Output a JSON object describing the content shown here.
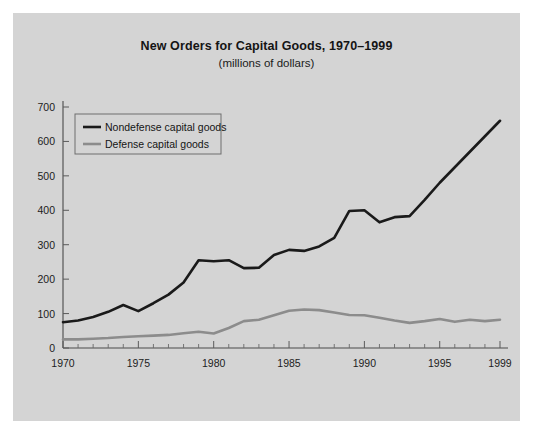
{
  "figure": {
    "background": "#d4d4d4",
    "page_background": "#ffffff"
  },
  "chart_data": {
    "type": "line",
    "title": "New Orders for Capital Goods, 1970–1999",
    "subtitle": "(millions of dollars)",
    "xlabel": "",
    "ylabel": "",
    "grid": false,
    "legend_position": "top-left",
    "xlim": [
      1970,
      1999
    ],
    "ylim": [
      0,
      700
    ],
    "yticks": [
      0,
      100,
      200,
      300,
      400,
      500,
      600,
      700
    ],
    "ytick_labels": [
      "0",
      "100",
      "200",
      "300",
      "400",
      "500",
      "600",
      "700"
    ],
    "xticks": [
      1970,
      1975,
      1980,
      1985,
      1990,
      1995,
      1999
    ],
    "xtick_labels": [
      "1970",
      "1975",
      "1980",
      "1985",
      "1990",
      "1995",
      "1999"
    ],
    "x": [
      1970,
      1971,
      1972,
      1973,
      1974,
      1975,
      1976,
      1977,
      1978,
      1979,
      1980,
      1981,
      1982,
      1983,
      1984,
      1985,
      1986,
      1987,
      1988,
      1989,
      1990,
      1991,
      1992,
      1993,
      1994,
      1995,
      1996,
      1997,
      1998,
      1999
    ],
    "series": [
      {
        "name": "Nondefense capital goods",
        "color": "#1a1a1a",
        "width": 2.6,
        "values": [
          75,
          80,
          90,
          105,
          125,
          107,
          130,
          155,
          190,
          255,
          252,
          255,
          232,
          233,
          270,
          285,
          282,
          295,
          320,
          398,
          400,
          365,
          380,
          383,
          430,
          480,
          525,
          570,
          615,
          660
        ]
      },
      {
        "name": "Defense capital goods",
        "color": "#8c8c8c",
        "width": 2.6,
        "values": [
          25,
          25,
          27,
          29,
          32,
          34,
          36,
          38,
          43,
          47,
          42,
          58,
          78,
          82,
          95,
          108,
          112,
          110,
          103,
          96,
          95,
          88,
          80,
          73,
          78,
          84,
          76,
          82,
          78,
          82
        ]
      }
    ]
  },
  "legend": {
    "entries": [
      {
        "label": "Nondefense capital goods",
        "color": "#1a1a1a"
      },
      {
        "label": "Defense capital goods",
        "color": "#8c8c8c"
      }
    ]
  }
}
